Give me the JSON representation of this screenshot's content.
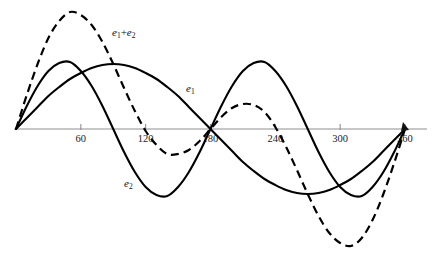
{
  "figure": {
    "title": "",
    "background_color": "#ffffff",
    "axis_color": "#8f8f8f",
    "curve_color": "#000000"
  },
  "axis": {
    "name": "x-axis-degrees",
    "x_start_px": 14,
    "x_end_px": 427,
    "y_px": 129,
    "origin_px": 16,
    "px_per_degree": 1.0805,
    "ticks": [
      {
        "label": "60",
        "value": 60
      },
      {
        "label": "120",
        "value": 120
      },
      {
        "label": "180",
        "value": 180
      },
      {
        "label": "240",
        "value": 240
      },
      {
        "label": "300",
        "value": 300
      },
      {
        "label": "360",
        "value": 360
      }
    ]
  },
  "labels": {
    "sum": {
      "base": "e",
      "sub1": "1",
      "op": "+",
      "base2": "e",
      "sub2": "2",
      "x": 112,
      "y": 36
    },
    "e1": {
      "base": "e",
      "sub": "1",
      "x": 186,
      "y": 92
    },
    "e2": {
      "base": "e",
      "sub": "2",
      "x": 124,
      "y": 187
    }
  },
  "chart_data": {
    "type": "line",
    "title": "",
    "xlabel": "",
    "ylabel": "",
    "xlim": [
      0,
      360
    ],
    "ylim": [
      -115,
      118
    ],
    "grid": false,
    "legend": "inline-annotations",
    "x_tick_labels": [
      "60",
      "120",
      "180",
      "240",
      "300",
      "360"
    ],
    "x_tick_values": [
      60,
      120,
      180,
      240,
      300,
      360
    ],
    "x": [
      0,
      10,
      20,
      30,
      40,
      50,
      60,
      70,
      80,
      90,
      100,
      110,
      120,
      130,
      140,
      150,
      160,
      170,
      180,
      190,
      200,
      210,
      220,
      230,
      240,
      250,
      260,
      270,
      280,
      290,
      300,
      310,
      320,
      330,
      340,
      350,
      360
    ],
    "series": [
      {
        "name": "e1",
        "style": "solid",
        "amplitude": 65,
        "cycles": 1.0,
        "phase_deg": 0,
        "description": "Fundamental sine, one cycle over 0 to 360 degrees, peak at 90 degrees, zero at 180 degrees, minimum near 285 degrees",
        "values": [
          0,
          11,
          22,
          33,
          42,
          50,
          56,
          61,
          64,
          65,
          64,
          61,
          56,
          50,
          42,
          33,
          22,
          11,
          0,
          -11,
          -22,
          -33,
          -42,
          -50,
          -56,
          -61,
          -64,
          -65,
          -64,
          -61,
          -56,
          -50,
          -42,
          -33,
          -22,
          -11,
          0
        ]
      },
      {
        "name": "e2",
        "style": "solid",
        "amplitude": 67,
        "cycles": 2.0,
        "phase_deg": 0,
        "description": "Second harmonic sine, two cycles over 0 to 360 degrees, first peak near 48 degrees, trough near 160 degrees, second peak near 225 degrees, second trough near 315 degrees",
        "values": [
          0,
          23,
          43,
          58,
          66,
          67,
          58,
          43,
          23,
          0,
          -23,
          -43,
          -58,
          -66,
          -67,
          -58,
          -43,
          -23,
          0,
          23,
          43,
          58,
          66,
          67,
          58,
          43,
          23,
          0,
          -23,
          -43,
          -58,
          -66,
          -67,
          -58,
          -43,
          -23,
          0
        ]
      },
      {
        "name": "e1+e2",
        "style": "dashed",
        "description": "Sum of e1 and e2, large peak near 50 degrees, dips below axis between 120 and 180 degrees, small secondary peak near 215 degrees, deep minimum near 305 degrees",
        "values": [
          0,
          34,
          65,
          91,
          108,
          117,
          114,
          104,
          87,
          65,
          41,
          18,
          -2,
          -16,
          -25,
          -25,
          -21,
          -12,
          0,
          12,
          21,
          25,
          24,
          17,
          2,
          -18,
          -41,
          -65,
          -87,
          -104,
          -114,
          -117,
          -109,
          -91,
          -65,
          -34,
          0
        ]
      }
    ],
    "annotations": [
      {
        "text": "e1 + e2",
        "at_x": 88,
        "at_y": 95
      },
      {
        "text": "e1",
        "at_x": 160,
        "at_y": 42
      },
      {
        "text": "e2",
        "at_x": 100,
        "at_y": -55
      }
    ]
  }
}
